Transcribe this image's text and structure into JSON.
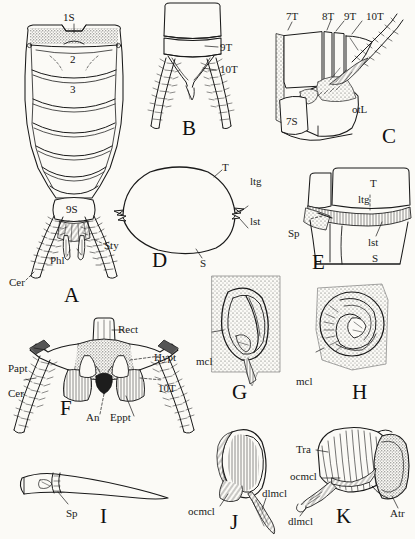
{
  "plate": {
    "title": "Comparative morphology of the terminal abdominal segments and spiracles",
    "background_color": "#fbfaf6",
    "ink_color": "#1a1a1a",
    "figure_count": 11
  },
  "figures": [
    {
      "id": "A",
      "letter": "A",
      "caption": "Dorsal view of abdomen showing segments and terminal appendages",
      "labels": [
        {
          "key": "1S",
          "text": "1S"
        },
        {
          "key": "2",
          "text": "2"
        },
        {
          "key": "3",
          "text": "3"
        },
        {
          "key": "9S",
          "text": "9S"
        },
        {
          "key": "Sty",
          "text": "Sty"
        },
        {
          "key": "Phl",
          "text": "Phl"
        },
        {
          "key": "Cer",
          "text": "Cer"
        }
      ]
    },
    {
      "id": "B",
      "letter": "B",
      "caption": "Terminal abdominal segments with cerci",
      "labels": [
        {
          "key": "9T",
          "text": "9T"
        },
        {
          "key": "10T",
          "text": "10T"
        }
      ]
    },
    {
      "id": "C",
      "letter": "C",
      "caption": "Lateral view of terminal segments with ovipositor lobe",
      "labels": [
        {
          "key": "7T",
          "text": "7T"
        },
        {
          "key": "8T",
          "text": "8T"
        },
        {
          "key": "9T",
          "text": "9T"
        },
        {
          "key": "10T",
          "text": "10T"
        },
        {
          "key": "7S",
          "text": "7S"
        },
        {
          "key": "otL",
          "text": "otL"
        }
      ]
    },
    {
      "id": "D",
      "letter": "D",
      "caption": "Cross section of abdominal segment",
      "labels": [
        {
          "key": "T",
          "text": "T"
        },
        {
          "key": "ltg",
          "text": "ltg"
        },
        {
          "key": "lst",
          "text": "lst"
        },
        {
          "key": "S",
          "text": "S"
        }
      ]
    },
    {
      "id": "E",
      "letter": "E",
      "caption": "Lateral body wall showing spiracle position",
      "labels": [
        {
          "key": "T",
          "text": "T"
        },
        {
          "key": "ltg",
          "text": "ltg"
        },
        {
          "key": "Sp",
          "text": "Sp"
        },
        {
          "key": "lst",
          "text": "lst"
        },
        {
          "key": "S",
          "text": "S"
        }
      ]
    },
    {
      "id": "F",
      "letter": "F",
      "caption": "Posterior view of terminal segment with anus and paraprocts",
      "labels": [
        {
          "key": "Rect",
          "text": "Rect"
        },
        {
          "key": "Papt",
          "text": "Papt"
        },
        {
          "key": "Hypt",
          "text": "Hypt"
        },
        {
          "key": "Cer",
          "text": "Cer"
        },
        {
          "key": "10T",
          "text": "10T"
        },
        {
          "key": "An",
          "text": "An"
        },
        {
          "key": "Eppt",
          "text": "Eppt"
        }
      ]
    },
    {
      "id": "G",
      "letter": "G",
      "caption": "Spiracle with closing muscle, external view",
      "labels": [
        {
          "key": "mcl",
          "text": "mcl"
        }
      ]
    },
    {
      "id": "H",
      "letter": "H",
      "caption": "Spiracle with closing muscle, oblique view",
      "labels": [
        {
          "key": "mcl",
          "text": "mcl"
        }
      ]
    },
    {
      "id": "I",
      "letter": "I",
      "caption": "Tracheal trunk with spiracle at base",
      "labels": [
        {
          "key": "Sp",
          "text": "Sp"
        }
      ]
    },
    {
      "id": "J",
      "letter": "J",
      "caption": "Spiracular apparatus with occlusor and dilator muscles",
      "labels": [
        {
          "key": "ocmcl",
          "text": "ocmcl"
        },
        {
          "key": "dlmcl",
          "text": "dlmcl"
        }
      ]
    },
    {
      "id": "K",
      "letter": "K",
      "caption": "Atrium and trachea with occlusor and dilator muscles",
      "labels": [
        {
          "key": "Tra",
          "text": "Tra"
        },
        {
          "key": "ocmcl",
          "text": "ocmcl"
        },
        {
          "key": "dlmcl",
          "text": "dlmcl"
        },
        {
          "key": "Atr",
          "text": "Atr"
        }
      ]
    }
  ]
}
